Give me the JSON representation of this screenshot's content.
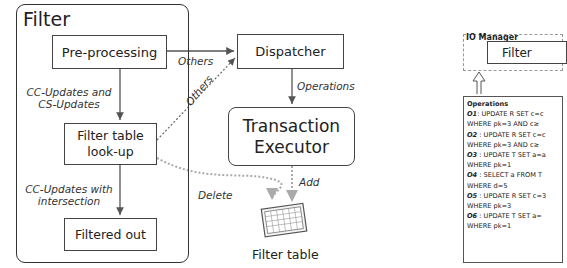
{
  "filter_group": {
    "title": "Filter",
    "nodes": {
      "preprocessing": "Pre-processing",
      "lookup_line1": "Filter table",
      "lookup_line2": "look-up",
      "filtered_out": "Filtered out"
    },
    "edges": {
      "cc_cs_updates_line1": "CC-Updates and",
      "cc_cs_updates_line2": "CS-Updates",
      "cc_intersection_line1": "CC-Updates with",
      "cc_intersection_line2": "intersection"
    }
  },
  "dispatcher": {
    "label": "Dispatcher"
  },
  "executor": {
    "line1": "Transaction",
    "line2": "Executor"
  },
  "filter_table": {
    "label": "Filter table"
  },
  "edge_labels": {
    "others_1": "Others",
    "others_2": "Others",
    "operations": "Operations",
    "delete": "Delete",
    "add": "Add"
  },
  "io_manager": {
    "title": "IO Manager",
    "filter_label": "Filter"
  },
  "operations_panel": {
    "title": "Operations",
    "items": [
      {
        "id": "O1",
        "stmt": ": UPDATE R SET c=c",
        "where": "WHERE pk=3 AND c≥"
      },
      {
        "id": "O2",
        "stmt": " : UPDATE R SET c=c",
        "where": "WHERE pk=3 AND c≥"
      },
      {
        "id": "O3",
        "stmt": " : UPDATE T SET a=a",
        "where": "WHERE pk=1"
      },
      {
        "id": "O4",
        "stmt": " : SELECT a FROM T",
        "where": "WHERE d=5"
      },
      {
        "id": "O5",
        "stmt": " : UPDATE R SET c=3",
        "where": "WHERE pk=3"
      },
      {
        "id": "O6",
        "stmt": " : UPDATE  T SET a=",
        "where": "WHERE pk=1"
      }
    ]
  }
}
